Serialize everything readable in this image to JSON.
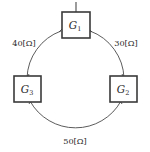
{
  "diagram": {
    "type": "three-node-ring-network",
    "background_color": "#ffffff",
    "line_color": "#4a4a4a",
    "box_border_color": "#3a3a3a",
    "text_color": "#2b2b2b",
    "nodes": [
      {
        "id": "g1",
        "name": "G",
        "subscript": "1",
        "position": "top",
        "box": {
          "x": 62,
          "y": 12,
          "width": 28,
          "height": 26
        },
        "has_stem": true
      },
      {
        "id": "g2",
        "name": "G",
        "subscript": "2",
        "position": "bottom-right",
        "box": {
          "x": 110,
          "y": 76,
          "width": 27,
          "height": 26
        },
        "has_stem": false
      },
      {
        "id": "g3",
        "name": "G",
        "subscript": "3",
        "position": "bottom-left",
        "box": {
          "x": 14,
          "y": 76,
          "width": 27,
          "height": 26
        },
        "has_stem": false
      }
    ],
    "edges": [
      {
        "id": "edge-g1-g3",
        "from": "g1",
        "to": "g3",
        "label": "40[Ω]",
        "label_x": 24,
        "label_y": 44
      },
      {
        "id": "edge-g1-g2",
        "from": "g1",
        "to": "g2",
        "label": "30[Ω]",
        "label_x": 126,
        "label_y": 44
      },
      {
        "id": "edge-g3-g2",
        "from": "g3",
        "to": "g2",
        "label": "50[Ω]",
        "label_x": 75,
        "label_y": 142
      }
    ],
    "ring": {
      "center_x": 75,
      "center_y": 75,
      "radius": 52
    }
  }
}
